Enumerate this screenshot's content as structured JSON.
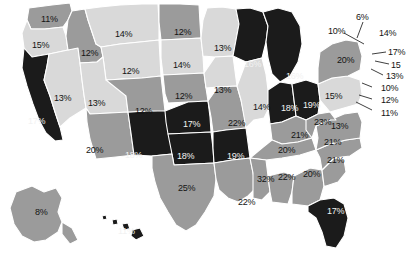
{
  "figure": {
    "type": "choropleth-map",
    "region": "United States",
    "value_suffix": "%",
    "background_color": "#ffffff",
    "border_color": "#ffffff"
  },
  "legend_tiers": [
    {
      "name": "light",
      "color": "#d9d9d9",
      "label_color": "#141414"
    },
    {
      "name": "mid",
      "color": "#9b9b9b",
      "label_color": "#141414"
    },
    {
      "name": "dark",
      "color": "#1b1b1b",
      "label_color": "#f2f2f2"
    }
  ],
  "chart_data": {
    "type": "heatmap",
    "title": "",
    "xlabel": "",
    "ylabel": "",
    "categories": [
      "WA",
      "OR",
      "CA",
      "NV",
      "ID",
      "MT",
      "WY",
      "UT",
      "AZ",
      "NM",
      "CO",
      "ND",
      "SD",
      "NE",
      "KS",
      "OK",
      "TX",
      "MN",
      "IA",
      "MO",
      "AR",
      "LA",
      "WI",
      "IL",
      "MI",
      "IN",
      "OH",
      "KY",
      "TN",
      "MS",
      "AL",
      "GA",
      "FL",
      "SC",
      "NC",
      "VA",
      "WV",
      "PA",
      "NY",
      "VT",
      "NH",
      "ME",
      "MA",
      "RI",
      "CT",
      "NJ",
      "DE",
      "MD",
      "AK",
      "HI"
    ],
    "values": [
      11,
      15,
      17,
      13,
      12,
      14,
      12,
      13,
      20,
      18,
      12,
      12,
      14,
      12,
      17,
      18,
      25,
      13,
      13,
      22,
      19,
      22,
      16,
      14,
      16,
      18,
      19,
      21,
      20,
      32,
      22,
      20,
      17,
      21,
      21,
      13,
      23,
      15,
      20,
      6,
      10,
      14,
      17,
      15,
      13,
      10,
      12,
      11,
      8,
      11
    ]
  },
  "states": [
    {
      "code": "WA",
      "value": "11%",
      "tier": "mid",
      "lx": 41,
      "ly": 15
    },
    {
      "code": "OR",
      "value": "15%",
      "tier": "light",
      "lx": 32,
      "ly": 41
    },
    {
      "code": "CA",
      "value": "17%",
      "tier": "dark",
      "lx": 28,
      "ly": 117
    },
    {
      "code": "NV",
      "value": "13%",
      "tier": "light",
      "lx": 54,
      "ly": 94
    },
    {
      "code": "ID",
      "value": "12%",
      "tier": "mid",
      "lx": 81,
      "ly": 49
    },
    {
      "code": "MT",
      "value": "14%",
      "tier": "light",
      "lx": 115,
      "ly": 30
    },
    {
      "code": "WY",
      "value": "12%",
      "tier": "light",
      "lx": 122,
      "ly": 67
    },
    {
      "code": "UT",
      "value": "13%",
      "tier": "light",
      "lx": 88,
      "ly": 99
    },
    {
      "code": "AZ",
      "value": "20%",
      "tier": "mid",
      "lx": 86,
      "ly": 146
    },
    {
      "code": "NM",
      "value": "18%",
      "tier": "dark",
      "lx": 125,
      "ly": 151
    },
    {
      "code": "CO",
      "value": "12%",
      "tier": "mid",
      "lx": 135,
      "ly": 107
    },
    {
      "code": "ND",
      "value": "12%",
      "tier": "mid",
      "lx": 174,
      "ly": 28
    },
    {
      "code": "SD",
      "value": "14%",
      "tier": "light",
      "lx": 173,
      "ly": 61
    },
    {
      "code": "NE",
      "value": "12%",
      "tier": "mid",
      "lx": 175,
      "ly": 92
    },
    {
      "code": "KS",
      "value": "17%",
      "tier": "dark",
      "lx": 183,
      "ly": 120
    },
    {
      "code": "OK",
      "value": "18%",
      "tier": "dark",
      "lx": 177,
      "ly": 152
    },
    {
      "code": "TX",
      "value": "25%",
      "tier": "mid",
      "lx": 178,
      "ly": 184
    },
    {
      "code": "MN",
      "value": "13%",
      "tier": "light",
      "lx": 214,
      "ly": 44
    },
    {
      "code": "IA",
      "value": "13%",
      "tier": "light",
      "lx": 214,
      "ly": 86
    },
    {
      "code": "MO",
      "value": "22%",
      "tier": "mid",
      "lx": 228,
      "ly": 119
    },
    {
      "code": "AR",
      "value": "19%",
      "tier": "dark",
      "lx": 227,
      "ly": 152
    },
    {
      "code": "LA",
      "value": "22%",
      "tier": "mid",
      "lx": 238,
      "ly": 198
    },
    {
      "code": "WI",
      "value": "16%",
      "tier": "dark",
      "lx": 244,
      "ly": 60
    },
    {
      "code": "IL",
      "value": "14%",
      "tier": "light",
      "lx": 253,
      "ly": 103
    },
    {
      "code": "MI",
      "value": "16%",
      "tier": "dark",
      "lx": 286,
      "ly": 72
    },
    {
      "code": "IN",
      "value": "18%",
      "tier": "dark",
      "lx": 281,
      "ly": 104
    },
    {
      "code": "OH",
      "value": "19%",
      "tier": "dark",
      "lx": 303,
      "ly": 101
    },
    {
      "code": "KY",
      "value": "21%",
      "tier": "mid",
      "lx": 291,
      "ly": 131
    },
    {
      "code": "TN",
      "value": "20%",
      "tier": "mid",
      "lx": 278,
      "ly": 146
    },
    {
      "code": "MS",
      "value": "32%",
      "tier": "mid",
      "lx": 257,
      "ly": 175
    },
    {
      "code": "AL",
      "value": "22%",
      "tier": "mid",
      "lx": 278,
      "ly": 173
    },
    {
      "code": "GA",
      "value": "20%",
      "tier": "mid",
      "lx": 303,
      "ly": 170
    },
    {
      "code": "FL",
      "value": "17%",
      "tier": "dark",
      "lx": 327,
      "ly": 207
    },
    {
      "code": "SC",
      "value": "21%",
      "tier": "mid",
      "lx": 327,
      "ly": 156
    },
    {
      "code": "NC",
      "value": "21%",
      "tier": "mid",
      "lx": 324,
      "ly": 138
    },
    {
      "code": "VA",
      "value": "13%",
      "tier": "mid",
      "lx": 331,
      "ly": 122
    },
    {
      "code": "WV",
      "value": "23%",
      "tier": "mid",
      "lx": 314,
      "ly": 118
    },
    {
      "code": "PA",
      "value": "15%",
      "tier": "light",
      "lx": 325,
      "ly": 92
    },
    {
      "code": "NY",
      "value": "20%",
      "tier": "mid",
      "lx": 337,
      "ly": 56
    },
    {
      "code": "AK",
      "value": "8%",
      "tier": "mid",
      "lx": 35,
      "ly": 208
    },
    {
      "code": "HI",
      "value": "11%",
      "tier": "dark",
      "lx": 118,
      "ly": 227
    }
  ],
  "callouts": [
    {
      "code": "VT",
      "value": "6%",
      "lx": 356,
      "ly": 13,
      "x1": 363,
      "y1": 22,
      "x2": 357,
      "y2": 38
    },
    {
      "code": "NH",
      "value": "10%",
      "lx": 328,
      "ly": 27,
      "x1": 344,
      "y1": 33,
      "x2": 364,
      "y2": 44
    },
    {
      "code": "ME",
      "value": "14%",
      "lx": 379,
      "ly": 29,
      "x1": 0,
      "y1": 0,
      "x2": 0,
      "y2": 0
    },
    {
      "code": "MA",
      "value": "17%",
      "lx": 388,
      "ly": 48,
      "x1": 386,
      "y1": 52,
      "x2": 372,
      "y2": 54
    },
    {
      "code": "RI",
      "value": "15",
      "lx": 391,
      "ly": 61,
      "x1": 389,
      "y1": 64,
      "x2": 375,
      "y2": 61
    },
    {
      "code": "CT",
      "value": "13%",
      "lx": 386,
      "ly": 72,
      "x1": 383,
      "y1": 75,
      "x2": 371,
      "y2": 69
    },
    {
      "code": "NJ",
      "value": "10%",
      "lx": 381,
      "ly": 84,
      "x1": 372,
      "y1": 87,
      "x2": 362,
      "y2": 83
    },
    {
      "code": "DE",
      "value": "12%",
      "lx": 381,
      "ly": 96,
      "x1": 372,
      "y1": 99,
      "x2": 359,
      "y2": 95
    },
    {
      "code": "MD",
      "value": "11%",
      "lx": 381,
      "ly": 109,
      "x1": 372,
      "y1": 110,
      "x2": 356,
      "y2": 102
    }
  ]
}
